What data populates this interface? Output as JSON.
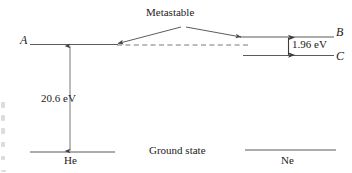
{
  "diagram": {
    "type": "energy-level-diagram",
    "colors": {
      "line": "#5b5b5b",
      "text": "#222222",
      "background": "#ffffff"
    },
    "labels": {
      "level_a": "A",
      "level_b": "B",
      "level_c": "C",
      "metastable": "Metastable",
      "transition_energy_he": "20.6 eV",
      "transition_energy_ne": "1.96 eV",
      "atom_he": "He",
      "atom_ne": "Ne",
      "ground_state": "Ground state"
    },
    "levels": [
      {
        "id": "A",
        "atom": "He",
        "label": "A",
        "energy_ev": 20.6,
        "kind": "metastable-excited"
      },
      {
        "id": "B",
        "atom": "Ne",
        "label": "B",
        "energy_ev": 20.6,
        "kind": "upper-laser"
      },
      {
        "id": "C",
        "atom": "Ne",
        "label": "C",
        "energy_ev": 18.64,
        "kind": "lower-laser"
      },
      {
        "id": "He-ground",
        "atom": "He",
        "label": "He",
        "energy_ev": 0,
        "kind": "ground"
      },
      {
        "id": "Ne-ground",
        "atom": "Ne",
        "label": "Ne",
        "energy_ev": 0,
        "kind": "ground"
      }
    ],
    "transitions": [
      {
        "from": "He-ground",
        "to": "A",
        "label": "20.6 eV",
        "style": "double-arrow-vertical"
      },
      {
        "from": "B",
        "to": "C",
        "label": "1.96 eV",
        "style": "double-arrow-vertical"
      },
      {
        "from": "A",
        "to": "B",
        "label": "Metastable",
        "style": "dashed-resonant-transfer"
      }
    ]
  }
}
